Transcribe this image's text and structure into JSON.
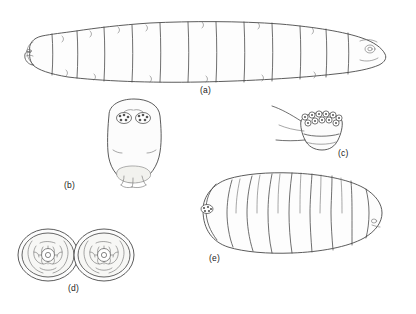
{
  "figure": {
    "background_color": "#ffffff",
    "line_color": "#4a4a4a",
    "panels": [
      {
        "id": "a",
        "label": "(a)",
        "name": "lateral-view-larva",
        "description": "Elongate segmented larva, lateral view, head at left, tapering posterior at right",
        "segment_count": 12
      },
      {
        "id": "b",
        "label": "(b)",
        "name": "dorsal-view-head-capsule",
        "description": "Rounded head capsule, dorsal view, with paired eye spot clusters near top and pale mouth region at base"
      },
      {
        "id": "c",
        "label": "(c)",
        "name": "posterior-spiracular-plate",
        "description": "Terminal segment showing row of spiracular openings along upper margin"
      },
      {
        "id": "d",
        "label": "(d)",
        "name": "transverse-sections-pair",
        "description": "Two oval transverse body sections showing convoluted internal tissue and central gut lumen"
      },
      {
        "id": "e",
        "label": "(e)",
        "name": "puparium-dorsal-view",
        "description": "Barrel-shaped segmented puparium, dorsal view, anterior spiracle cluster at left"
      }
    ],
    "labels": {
      "a": "(a)",
      "b": "(b)",
      "c": "(c)",
      "d": "(d)",
      "e": "(e)"
    }
  }
}
